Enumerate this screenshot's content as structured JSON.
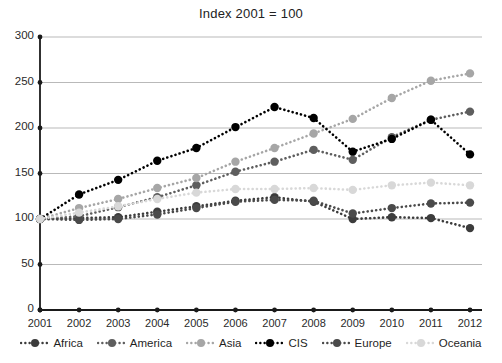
{
  "chart_data": {
    "type": "line",
    "title": "Index 2001 = 100",
    "xlabel": "",
    "ylabel": "",
    "categories": [
      "2001",
      "2002",
      "2003",
      "2004",
      "2005",
      "2006",
      "2007",
      "2008",
      "2009",
      "2010",
      "2011",
      "2012"
    ],
    "x": [
      2001,
      2002,
      2003,
      2004,
      2005,
      2006,
      2007,
      2008,
      2009,
      2010,
      2011,
      2012
    ],
    "ylim": [
      0,
      300
    ],
    "yticks": [
      0,
      50,
      100,
      150,
      200,
      250,
      300
    ],
    "grid": true,
    "legend_position": "bottom",
    "series": [
      {
        "name": "Africa",
        "color": "#3c3c3c",
        "values": [
          100,
          101,
          102,
          108,
          114,
          120,
          124,
          119,
          100,
          102,
          101,
          90
        ]
      },
      {
        "name": "America",
        "color": "#5e5e5e",
        "values": [
          100,
          103,
          113,
          124,
          137,
          152,
          163,
          176,
          165,
          190,
          209,
          218
        ]
      },
      {
        "name": "Asia",
        "color": "#a6a6a6",
        "values": [
          100,
          112,
          122,
          134,
          145,
          163,
          178,
          194,
          210,
          233,
          252,
          260
        ]
      },
      {
        "name": "CIS",
        "color": "#000000",
        "values": [
          100,
          127,
          143,
          164,
          178,
          201,
          223,
          211,
          174,
          188,
          209,
          171
        ]
      },
      {
        "name": "Europe",
        "color": "#4a4a4a",
        "values": [
          100,
          99,
          100,
          105,
          112,
          119,
          121,
          120,
          106,
          112,
          117,
          118
        ]
      },
      {
        "name": "Oceania",
        "color": "#d8d8d8",
        "values": [
          100,
          107,
          114,
          122,
          129,
          133,
          133,
          134,
          132,
          137,
          140,
          137
        ]
      }
    ]
  },
  "axes": {
    "ytick_labels": [
      "300",
      "250",
      "200",
      "150",
      "100",
      "50",
      "0"
    ],
    "xtick_labels": [
      "2001",
      "2002",
      "2003",
      "2004",
      "2005",
      "2006",
      "2007",
      "2008",
      "2009",
      "2010",
      "2011",
      "2012"
    ]
  },
  "legend": {
    "items": [
      {
        "label": "Africa"
      },
      {
        "label": "America"
      },
      {
        "label": "Asia"
      },
      {
        "label": "CIS"
      },
      {
        "label": "Europe"
      },
      {
        "label": "Oceania"
      }
    ]
  }
}
